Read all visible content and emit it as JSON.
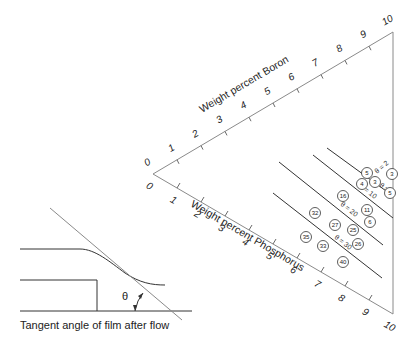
{
  "diagram": {
    "type": "ternary-style composition chart",
    "boron_axis": {
      "title": "Weight percent Boron",
      "ticks": [
        "0",
        "1",
        "2",
        "3",
        "4",
        "5",
        "6",
        "7",
        "8",
        "9",
        "10"
      ]
    },
    "phosphorus_axis": {
      "title": "Weight percent Phosphorus",
      "ticks": [
        "0",
        "1",
        "2",
        "3",
        "4",
        "5",
        "6",
        "7",
        "8",
        "9",
        "10"
      ]
    },
    "isolines": [
      {
        "label": "θ = 2"
      },
      {
        "label": "θ = 5"
      },
      {
        "label": "θ = 10"
      },
      {
        "label": "θ = 20"
      },
      {
        "label": "θ = 30"
      }
    ],
    "data_points": [
      {
        "label": "5",
        "x": 367,
        "y": 173
      },
      {
        "label": "3",
        "x": 392,
        "y": 174
      },
      {
        "label": "4",
        "x": 362,
        "y": 184
      },
      {
        "label": "3",
        "x": 375,
        "y": 182
      },
      {
        "label": "5",
        "x": 390,
        "y": 193
      },
      {
        "label": "16",
        "x": 343,
        "y": 196
      },
      {
        "label": "11",
        "x": 367,
        "y": 210
      },
      {
        "label": "6",
        "x": 370,
        "y": 222
      },
      {
        "label": "32",
        "x": 315,
        "y": 213
      },
      {
        "label": "27",
        "x": 335,
        "y": 225
      },
      {
        "label": "25",
        "x": 353,
        "y": 230
      },
      {
        "label": "26",
        "x": 358,
        "y": 244
      },
      {
        "label": "35",
        "x": 306,
        "y": 237
      },
      {
        "label": "33",
        "x": 323,
        "y": 246
      },
      {
        "label": "40",
        "x": 343,
        "y": 262
      }
    ],
    "inset": {
      "theta_symbol": "θ",
      "caption": "Tangent angle of film after flow"
    }
  }
}
